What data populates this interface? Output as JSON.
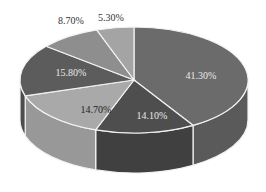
{
  "chart_data": {
    "type": "pie",
    "style": "3d",
    "title": "",
    "slices": [
      {
        "label": "41.30%",
        "value": 41.3,
        "color": "#6b6b6b",
        "side": "#5a5a5a",
        "text": "#e8e8e8"
      },
      {
        "label": "14.10%",
        "value": 14.1,
        "color": "#4e4e4e",
        "side": "#404040",
        "text": "#e8e8e8"
      },
      {
        "label": "14.70%",
        "value": 14.7,
        "color": "#a9a9a9",
        "side": "#989898",
        "text": "#222222"
      },
      {
        "label": "15.80%",
        "value": 15.8,
        "color": "#5c5c5c",
        "side": "#4c4c4c",
        "text": "#e8e8e8"
      },
      {
        "label": "8.70%",
        "value": 8.7,
        "color": "#8e8e8e",
        "side": "#7e7e7e",
        "text": "#333333"
      },
      {
        "label": "5.30%",
        "value": 5.3,
        "color": "#a4a4a4",
        "side": "#949494",
        "text": "#333333"
      }
    ],
    "legend": "none"
  }
}
